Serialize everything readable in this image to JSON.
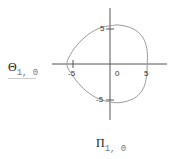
{
  "chart_data": {
    "type": "line",
    "title": "",
    "xlabel": "Π",
    "xlabel_subscript": "1, 0",
    "ylabel": "Θ",
    "ylabel_subscript": "1, 0",
    "xlim": [
      -8,
      8
    ],
    "ylim": [
      -8,
      8
    ],
    "grid": false,
    "axes_style": "crossed",
    "x_ticks": [
      "-5",
      "0",
      "5"
    ],
    "y_ticks": [
      "5",
      "-5"
    ],
    "series": [
      {
        "name": "Θ vs Π",
        "color": "#9a9a9a",
        "points": [
          [
            1.0,
            5.6
          ],
          [
            2.5,
            5.3
          ],
          [
            3.8,
            4.6
          ],
          [
            4.7,
            3.4
          ],
          [
            5.1,
            1.8
          ],
          [
            5.1,
            0.0
          ],
          [
            5.0,
            -1.8
          ],
          [
            4.6,
            -3.4
          ],
          [
            3.6,
            -4.7
          ],
          [
            2.0,
            -5.4
          ],
          [
            0.5,
            -5.5
          ],
          [
            -1.5,
            -5.0
          ],
          [
            -3.2,
            -3.9
          ],
          [
            -4.6,
            -2.4
          ],
          [
            -5.6,
            -0.9
          ],
          [
            -5.9,
            0.0
          ],
          [
            -5.6,
            1.0
          ],
          [
            -4.6,
            2.6
          ],
          [
            -3.0,
            4.2
          ],
          [
            -1.2,
            5.2
          ],
          [
            1.0,
            5.6
          ]
        ]
      }
    ]
  }
}
